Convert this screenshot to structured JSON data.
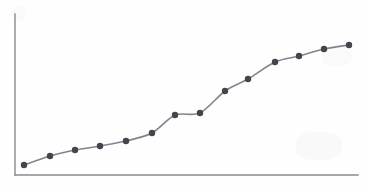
{
  "chart_data": {
    "type": "line",
    "title": "",
    "subtitle": "",
    "xlabel": "",
    "ylabel": "",
    "grid": false,
    "legend": false,
    "legend_position": "none",
    "xlim": [
      0,
      15
    ],
    "ylim": [
      0,
      10
    ],
    "x_tick_labels": [],
    "y_tick_labels": [],
    "axis_ticks": false,
    "series": [
      {
        "name": "series-1",
        "marker": "circle",
        "line_color": "#83838c",
        "marker_color": "#44444c",
        "x": [
          1,
          2,
          3,
          4,
          5,
          6,
          7,
          8,
          9,
          10,
          11,
          12,
          13,
          14
        ],
        "values": [
          0.65,
          1.25,
          1.65,
          1.92,
          2.25,
          2.78,
          3.95,
          4.08,
          5.55,
          6.35,
          7.48,
          7.88,
          8.35,
          8.62
        ]
      }
    ],
    "pixel_points": [
      [
        24,
        165
      ],
      [
        50,
        156
      ],
      [
        75,
        150
      ],
      [
        100,
        146
      ],
      [
        126,
        141
      ],
      [
        152,
        133
      ],
      [
        175,
        115
      ],
      [
        200,
        113
      ],
      [
        225,
        91
      ],
      [
        248,
        79
      ],
      [
        275,
        62
      ],
      [
        299,
        56
      ],
      [
        324,
        49
      ],
      [
        349,
        45
      ]
    ]
  },
  "figure": {
    "axis_color": "#8a8a90",
    "background_color": "#fefefe",
    "plot_area": {
      "left": 15,
      "top": 14,
      "right": 358,
      "bottom": 175
    },
    "marker_radius": 3.2,
    "line_width": 1.6,
    "axis_width": 1.4
  }
}
